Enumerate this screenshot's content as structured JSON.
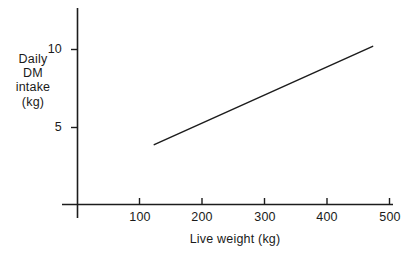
{
  "chart_data": {
    "type": "line",
    "title": "",
    "subtitle": "",
    "xlabel": "Live weight (kg)",
    "ylabel": "Daily DM intake (kg)",
    "ylabel_lines": [
      "Daily",
      "DM",
      "intake",
      "(kg)"
    ],
    "xlim": [
      0,
      500
    ],
    "ylim": [
      0,
      12.5
    ],
    "xticks": [
      100,
      200,
      300,
      400,
      500
    ],
    "xtick_labels": [
      "100",
      "200",
      "300",
      "400",
      "500"
    ],
    "yticks": [
      5,
      10
    ],
    "ytick_labels": [
      "5",
      "10"
    ],
    "grid": false,
    "legend": false,
    "legend_position": "none",
    "series": [
      {
        "name": "Daily DM intake",
        "x": [
          123,
          473
        ],
        "y": [
          3.9,
          10.2
        ],
        "points": [
          {
            "x": 123,
            "y": 3.9
          },
          {
            "x": 473,
            "y": 10.2
          }
        ]
      }
    ],
    "annotations": [],
    "line_color": "#1c1c1c",
    "axis_color": "#1c1c1c",
    "background_color": "#ffffff"
  },
  "figure": {
    "axis_color": "#1c1c1c",
    "line_color": "#1c1c1c",
    "background": "#ffffff"
  }
}
